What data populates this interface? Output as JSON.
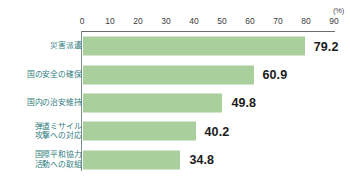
{
  "chart_data": {
    "type": "bar",
    "orientation": "horizontal",
    "title": "",
    "xlabel": "",
    "ylabel": "",
    "unit_label": "(%)",
    "xlim": [
      0,
      90
    ],
    "xticks": [
      0,
      10,
      20,
      30,
      40,
      50,
      60,
      70,
      80,
      90
    ],
    "xtick_labels": [
      "0",
      "10",
      "20",
      "30",
      "40",
      "50",
      "60",
      "70",
      "80",
      "90"
    ],
    "grid": false,
    "legend": null,
    "categories": [
      "災害派遣",
      "国の安全の確保",
      "国内の治安維持",
      "弾道ミサイル\n攻撃への対応",
      "国際平和協力\n活動への取組"
    ],
    "values": [
      79.2,
      60.9,
      49.8,
      40.2,
      34.8
    ],
    "value_labels": [
      "79.2",
      "60.9",
      "49.8",
      "40.2",
      "34.8"
    ],
    "bar_color": "#a9cf9d",
    "category_label_color": "#2f7d80",
    "value_label_color": "#1b1b1b",
    "axis_color": "#6b6b6b"
  }
}
